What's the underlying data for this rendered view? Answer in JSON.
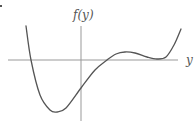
{
  "chart_data": {
    "type": "line",
    "title": "",
    "xlabel": "y",
    "ylabel": "f(y)",
    "grid": false,
    "legend": null,
    "features": {
      "roots": [
        "left of vertical axis (simple)",
        "right of vertical axis (simple)",
        "far right (tangent / double root)"
      ],
      "global_minimum": "left of vertical axis, well below axis",
      "y_intercept": "negative",
      "local_maximum": "small, above axis between second and third roots",
      "end_behavior": "rises on both ends"
    },
    "series": [
      {
        "name": "f(y)",
        "points_px": [
          [
            26,
            26
          ],
          [
            31,
            60
          ],
          [
            40,
            95
          ],
          [
            50,
            110
          ],
          [
            57,
            112
          ],
          [
            66,
            108
          ],
          [
            81,
            88
          ],
          [
            95,
            70
          ],
          [
            107,
            60
          ],
          [
            116,
            54
          ],
          [
            125,
            52
          ],
          [
            135,
            53
          ],
          [
            147,
            57
          ],
          [
            157,
            59
          ],
          [
            166,
            57
          ],
          [
            174,
            45
          ],
          [
            181,
            29
          ]
        ]
      }
    ],
    "axes_px": {
      "horizontal": {
        "y": 60,
        "x_from": 8,
        "x_to": 178
      },
      "vertical": {
        "x": 81,
        "y_from": 26,
        "y_to": 121
      }
    },
    "colors": {
      "curve": "#555555",
      "axes": "#999999",
      "labels": "#555555"
    }
  },
  "labels": {
    "vertical_axis": "f(y)",
    "horizontal_axis": "y"
  }
}
